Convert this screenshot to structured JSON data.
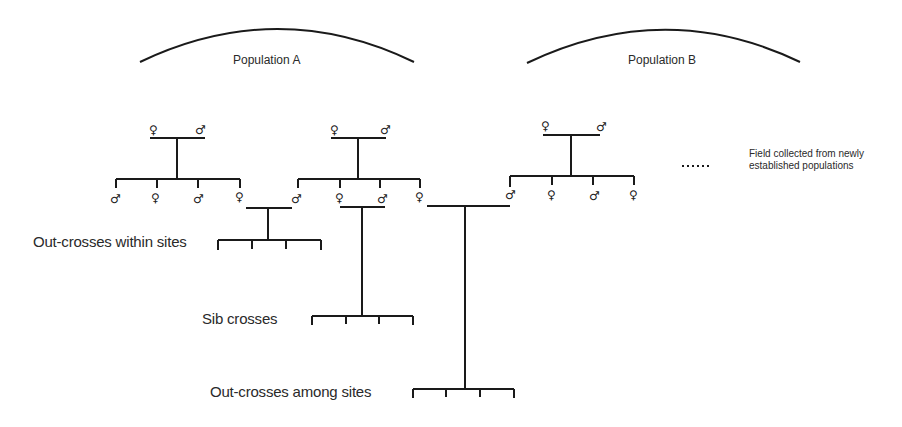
{
  "diagram": {
    "populations": [
      {
        "id": "A",
        "label": "Population A"
      },
      {
        "id": "B",
        "label": "Population B"
      }
    ],
    "cross_types": {
      "within": "Out-crosses within sites",
      "sib": "Sib crosses",
      "among": "Out-crosses among sites"
    },
    "legend": {
      "dots": "......",
      "note_line1": "Field collected from newly",
      "note_line2": "established populations"
    },
    "symbols": {
      "female": "♀",
      "male": "♂"
    },
    "families": [
      {
        "population": "A",
        "parents": [
          "♀",
          "♂"
        ],
        "offspring": [
          "♂",
          "♀",
          "♂",
          "♀"
        ]
      },
      {
        "population": "A",
        "parents": [
          "♀",
          "♂"
        ],
        "offspring": [
          "♂",
          "♀",
          "♂",
          "♀"
        ]
      },
      {
        "population": "B",
        "parents": [
          "♀",
          "♂"
        ],
        "offspring": [
          "♂",
          "♀",
          "♂",
          "♀"
        ]
      }
    ]
  }
}
